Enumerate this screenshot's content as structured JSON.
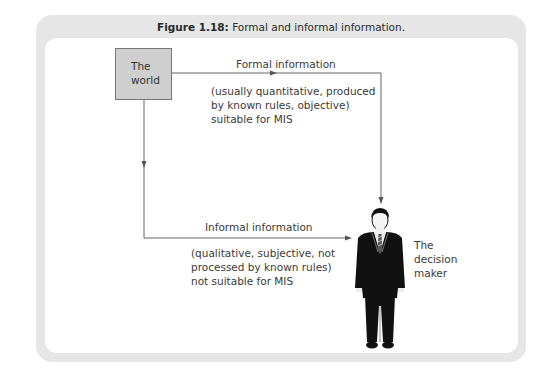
{
  "figure": {
    "title_prefix": "Figure 1.18:",
    "title_text": "Formal and informal information."
  },
  "nodes": {
    "source": {
      "line1": "The",
      "line2": "world"
    },
    "target": {
      "line1": "The",
      "line2": "decision",
      "line3": "maker",
      "icon": "businessman-icon"
    }
  },
  "edges": {
    "formal": {
      "label": "Formal information",
      "desc_line1": "(usually quantitative, produced",
      "desc_line2": "by known rules, objective)",
      "desc_line3": "suitable for MIS"
    },
    "informal": {
      "label": "Informal information",
      "desc_line1": "(qualitative, subjective, not",
      "desc_line2": "processed by known rules)",
      "desc_line3": "not suitable for MIS"
    }
  },
  "colors": {
    "frame": "#e6e6e6",
    "box_fill": "#cfcfcf",
    "line": "#666666",
    "text": "#3a3a3a"
  }
}
